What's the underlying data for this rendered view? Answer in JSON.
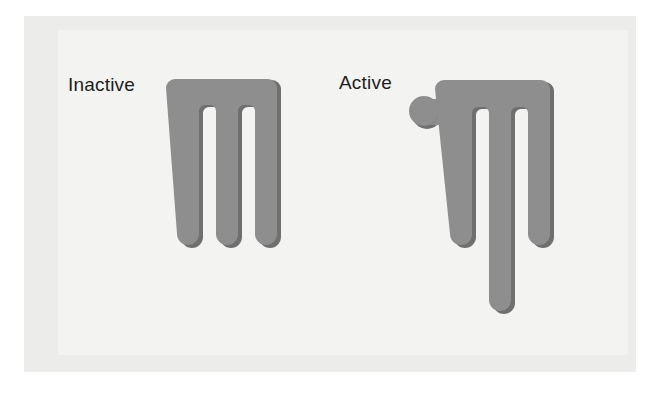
{
  "figure": {
    "background_color": "#ffffff",
    "mat_color": "#ececeb",
    "panel_color": "#f3f3f1",
    "shape_color": "#8e8e8e",
    "shadow_color": "#6f6f70",
    "label_color": "#1d1d1d",
    "panels": [
      {
        "key": "inactive",
        "label": "Inactive",
        "state": "inactive",
        "legs": 3,
        "ligand_present": false,
        "middle_leg_extended": false
      },
      {
        "key": "active",
        "label": "Active",
        "state": "active",
        "legs": 3,
        "ligand_present": true,
        "middle_leg_extended": true
      }
    ]
  }
}
